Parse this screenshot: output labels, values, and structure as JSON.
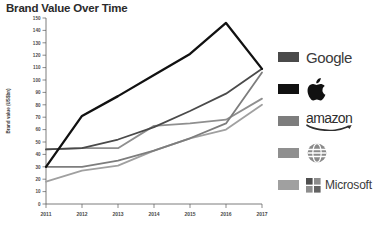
{
  "chart_data": {
    "type": "line",
    "title": "Brand Value Over Time",
    "xlabel": "",
    "ylabel": "Brand value (US$bn)",
    "x": [
      2011,
      2012,
      2013,
      2014,
      2015,
      2016,
      2017
    ],
    "categories": [
      "2011",
      "2012",
      "2013",
      "2014",
      "2015",
      "2016",
      "2017"
    ],
    "xlim": [
      2011,
      2017
    ],
    "ylim": [
      0,
      150
    ],
    "ytick_step": 10,
    "yticks": [
      0,
      10,
      20,
      30,
      40,
      50,
      60,
      70,
      80,
      90,
      100,
      110,
      120,
      130,
      140,
      150
    ],
    "ytick_labels": [
      "0",
      "10",
      "20",
      "30",
      "40",
      "50",
      "60",
      "70",
      "80",
      "90",
      "100",
      "110",
      "120",
      "130",
      "140",
      "150"
    ],
    "grid": false,
    "legend_position": "right",
    "series": [
      {
        "name": "Apple",
        "legend_label": "",
        "color": "#111111",
        "values": [
          30,
          71,
          87,
          104,
          121,
          146,
          109
        ]
      },
      {
        "name": "Google",
        "legend_label": "Google",
        "color": "#4a4a4a",
        "values": [
          44,
          45,
          52,
          62,
          75,
          89,
          109
        ]
      },
      {
        "name": "Amazon",
        "legend_label": "amazon",
        "color": "#7d7d7d",
        "values": [
          30,
          30,
          35,
          43,
          53,
          65,
          106
        ]
      },
      {
        "name": "AT&T",
        "legend_label": "",
        "color": "#8f8f8f",
        "values": [
          44,
          45,
          45,
          63,
          65,
          68,
          85
        ]
      },
      {
        "name": "Microsoft",
        "legend_label": "Microsoft",
        "color": "#a0a0a0",
        "values": [
          18,
          27,
          31,
          43,
          53,
          60,
          80
        ]
      }
    ]
  },
  "legend": {
    "items": [
      {
        "label": "Google",
        "swatch_color": "#4a4a4a",
        "icon": "google-wordmark"
      },
      {
        "label": "",
        "swatch_color": "#111111",
        "icon": "apple-logo-icon"
      },
      {
        "label": "amazon",
        "swatch_color": "#7d7d7d",
        "icon": "amazon-wordmark"
      },
      {
        "label": "",
        "swatch_color": "#8f8f8f",
        "icon": "att-globe-icon"
      },
      {
        "label": "Microsoft",
        "swatch_color": "#a0a0a0",
        "icon": "microsoft-squares-icon"
      }
    ]
  }
}
